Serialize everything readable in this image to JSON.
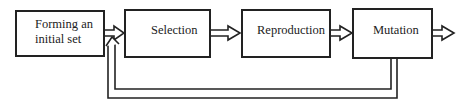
{
  "diagram": {
    "nodes": [
      {
        "id": "init",
        "label_line1": "Forming an",
        "label_line2": "initial set"
      },
      {
        "id": "selection",
        "label": "Selection"
      },
      {
        "id": "reproduction",
        "label": "Reproduction"
      },
      {
        "id": "mutation",
        "label": "Mutation"
      }
    ],
    "edges": [
      {
        "from": "init",
        "to": "selection"
      },
      {
        "from": "selection",
        "to": "reproduction"
      },
      {
        "from": "reproduction",
        "to": "mutation"
      },
      {
        "from": "mutation",
        "to": "output"
      },
      {
        "from": "mutation",
        "to": "selection",
        "type": "feedback"
      }
    ]
  }
}
